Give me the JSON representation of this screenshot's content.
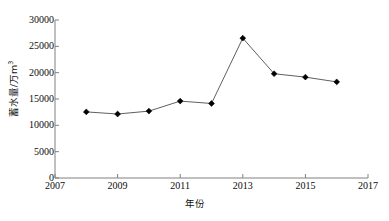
{
  "chart_data": {
    "type": "line",
    "title": "",
    "xlabel": "年份",
    "ylabel": "蓄水量/万m³",
    "ylabel_main": "蓄水量/万m",
    "ylabel_sup": "3",
    "x": [
      2008,
      2009,
      2010,
      2011,
      2012,
      2013,
      2014,
      2015,
      2016
    ],
    "values": [
      12550,
      12150,
      12700,
      14600,
      14150,
      26550,
      19800,
      19150,
      18250
    ],
    "series": [
      {
        "name": "蓄水量",
        "values": [
          12550,
          12150,
          12700,
          14600,
          14150,
          26550,
          19800,
          19150,
          18250
        ]
      }
    ],
    "xlim": [
      2007,
      2017
    ],
    "ylim": [
      0,
      30000
    ],
    "xticks": [
      2007,
      2009,
      2011,
      2013,
      2015,
      2017
    ],
    "xtick_labels": [
      "2007",
      "2009",
      "2011",
      "2013",
      "2015",
      "2017"
    ],
    "yticks": [
      0,
      5000,
      10000,
      15000,
      20000,
      25000,
      30000
    ],
    "ytick_labels": [
      "0",
      "5000",
      "10000",
      "15000",
      "20000",
      "25000",
      "30000"
    ],
    "grid": false,
    "legend": null,
    "marker": "diamond",
    "marker_color": "#000000",
    "line_color": "#4d4d4d",
    "axis_color": "#808080",
    "background": "#ffffff"
  }
}
